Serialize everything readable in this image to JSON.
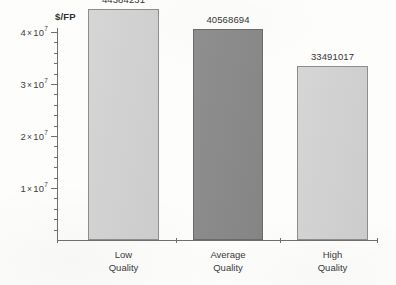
{
  "chart_data": {
    "type": "bar",
    "title": "",
    "xlabel": "",
    "ylabel": "$/FP",
    "categories": [
      "Low Quality",
      "Average Quality",
      "High Quality"
    ],
    "category_lines": [
      [
        "Low",
        "Quality"
      ],
      [
        "Average",
        "Quality"
      ],
      [
        "High",
        "Quality"
      ]
    ],
    "values": [
      44384231,
      40568694,
      33491017
    ],
    "value_labels": [
      "44384231",
      "40568694",
      "33491017"
    ],
    "bar_colors": [
      "#d2d2d2",
      "#8a8a8a",
      "#d2d2d2"
    ],
    "ylim": [
      0,
      46000000
    ],
    "ytick_values": [
      10000000,
      20000000,
      30000000,
      40000000
    ],
    "ytick_labels": [
      {
        "mantissa": "1",
        "times": "×",
        "base": "10",
        "exponent": "7"
      },
      {
        "mantissa": "2",
        "times": "×",
        "base": "10",
        "exponent": "7"
      },
      {
        "mantissa": "3",
        "times": "×",
        "base": "10",
        "exponent": "7"
      },
      {
        "mantissa": "4",
        "times": "×",
        "base": "10",
        "exponent": "7"
      }
    ],
    "minor_tick_interval": 2000000,
    "grid": false,
    "legend": null,
    "legend_position": "none",
    "axis_color": "#6f6f6f",
    "background_color": "#fdfdfc"
  }
}
